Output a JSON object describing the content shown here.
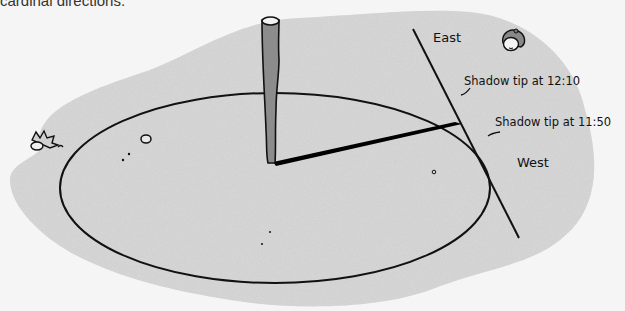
{
  "caption": {
    "text": "cardinal directions."
  },
  "diagram": {
    "labels": {
      "east": "East",
      "west": "West",
      "shadow_tip_1": "Shadow tip at 12:10",
      "shadow_tip_2": "Shadow tip at 11:50"
    },
    "elements": {
      "stick": "vertical-stick",
      "shadow": "stick-shadow",
      "circle": "traced-circle",
      "east_west_line": "east-west-line",
      "ground": "sandy-ground-patch",
      "plant": "small-plant",
      "character": "peeking-character-head"
    },
    "colors": {
      "background": "#f5f5f5",
      "ground": "#d9d9d9",
      "line": "#111111",
      "stick": "#8c8c8c",
      "shadow": "#000000"
    }
  }
}
